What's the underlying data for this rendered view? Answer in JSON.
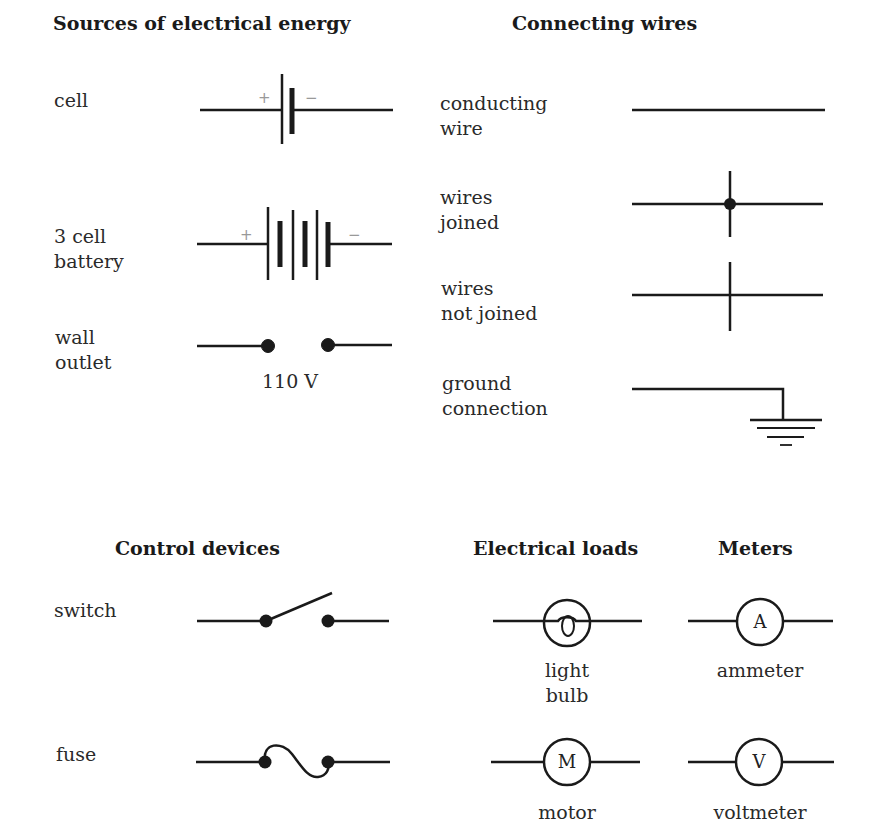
{
  "sections": {
    "sources": {
      "heading": "Sources of electrical energy",
      "items": [
        {
          "label": "cell",
          "plus": "+",
          "minus": "−"
        },
        {
          "label": "3 cell\nbattery",
          "plus": "+",
          "minus": "−"
        },
        {
          "label": "wall\noutlet",
          "caption": "110 V"
        }
      ]
    },
    "wires": {
      "heading": "Connecting wires",
      "items": [
        {
          "label": "conducting\nwire"
        },
        {
          "label": "wires\njoined"
        },
        {
          "label": "wires\nnot joined"
        },
        {
          "label": "ground\nconnection"
        }
      ]
    },
    "controls": {
      "heading": "Control devices",
      "items": [
        {
          "label": "switch"
        },
        {
          "label": "fuse"
        }
      ]
    },
    "loads": {
      "heading": "Electrical loads",
      "items": [
        {
          "caption": "light\nbulb"
        },
        {
          "caption": "motor",
          "symbol_letter": "M"
        }
      ]
    },
    "meters": {
      "heading": "Meters",
      "items": [
        {
          "caption": "ammeter",
          "symbol_letter": "A"
        },
        {
          "caption": "voltmeter",
          "symbol_letter": "V"
        }
      ]
    }
  },
  "colors": {
    "stroke": "#1a1a1a",
    "polarity": "#999999",
    "background": "#ffffff"
  }
}
